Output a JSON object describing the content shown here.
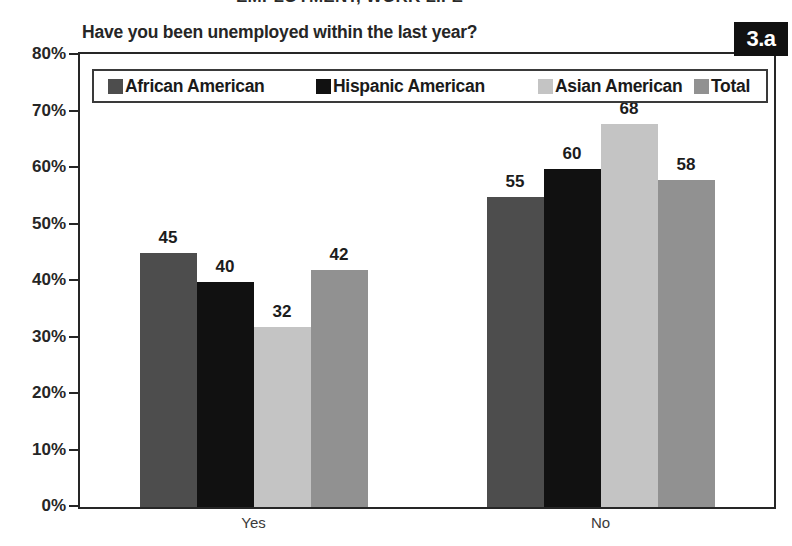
{
  "supertitle": "EMPLOYMENT, WORK LIFE",
  "badge": {
    "label": "3.a"
  },
  "chart_data": {
    "type": "bar",
    "title": "Have you been unemployed within the last year?",
    "xlabel": "",
    "ylabel": "",
    "categories": [
      "Yes",
      "No"
    ],
    "series": [
      {
        "name": "African American",
        "values": [
          45,
          40
        ],
        "color": "#4d4d4d"
      },
      {
        "name": "Hispanic American",
        "values": [
          40,
          60
        ],
        "color": "#111111"
      },
      {
        "name": "Asian American",
        "values": [
          32,
          68
        ],
        "color": "#c4c4c4"
      },
      {
        "name": "Total",
        "values": [
          42,
          58
        ],
        "color": "#919191"
      }
    ],
    "series_values_by_category": {
      "Yes": {
        "African American": 45,
        "Hispanic American": 40,
        "Asian American": 32,
        "Total": 42
      },
      "No": {
        "African American": 55,
        "Hispanic American": 60,
        "Asian American": 68,
        "Total": 58
      }
    },
    "bars": [
      {
        "category": "Yes",
        "series": "African American",
        "value": 45,
        "label": "45"
      },
      {
        "category": "Yes",
        "series": "Hispanic American",
        "value": 40,
        "label": "40"
      },
      {
        "category": "Yes",
        "series": "Asian American",
        "value": 32,
        "label": "32"
      },
      {
        "category": "Yes",
        "series": "Total",
        "value": 42,
        "label": "42"
      },
      {
        "category": "No",
        "series": "African American",
        "value": 55,
        "label": "55"
      },
      {
        "category": "No",
        "series": "Hispanic American",
        "value": 60,
        "label": "60"
      },
      {
        "category": "No",
        "series": "Asian American",
        "value": 68,
        "label": "68"
      },
      {
        "category": "No",
        "series": "Total",
        "value": 58,
        "label": "58"
      }
    ],
    "ylim": [
      0,
      80
    ],
    "yticks": [
      0,
      10,
      20,
      30,
      40,
      50,
      60,
      70,
      80
    ],
    "ytick_labels": [
      "0%",
      "10%",
      "20%",
      "30%",
      "40%",
      "50%",
      "60%",
      "70%",
      "80%"
    ],
    "grid": false,
    "legend_position": "top-inside",
    "value_labels": true,
    "units": "percent"
  }
}
